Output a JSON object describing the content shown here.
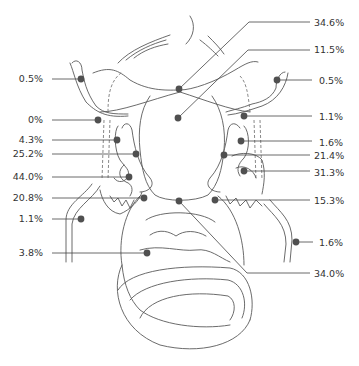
{
  "diagram": {
    "marker_color": "#505050",
    "line_color": "#444444",
    "text_color": "#333333",
    "callouts": [
      {
        "id": "left-tube-fimbria-top",
        "side": "left",
        "value": "0.5%"
      },
      {
        "id": "left-tube-isthmus",
        "side": "left",
        "value": "0%"
      },
      {
        "id": "left-tube-ampulla-upper",
        "side": "left",
        "value": "4.3%"
      },
      {
        "id": "left-ovary-upper",
        "side": "left",
        "value": "25.2%"
      },
      {
        "id": "left-ovary-mid",
        "side": "left",
        "value": "44.0%"
      },
      {
        "id": "left-ovary-lower",
        "side": "left",
        "value": "20.8%"
      },
      {
        "id": "left-ligament",
        "side": "left",
        "value": "1.1%"
      },
      {
        "id": "cervix-body",
        "side": "left",
        "value": "3.8%"
      },
      {
        "id": "uterus-fundus-top",
        "side": "right",
        "value": "34.6%"
      },
      {
        "id": "uterus-body-center",
        "side": "right",
        "value": "11.5%"
      },
      {
        "id": "right-tube-fimbria-top",
        "side": "right",
        "value": "0.5%"
      },
      {
        "id": "right-tube-isthmus",
        "side": "right",
        "value": "1.1%"
      },
      {
        "id": "right-tube-ampulla",
        "side": "right",
        "value": "1.6%"
      },
      {
        "id": "right-ovary-upper",
        "side": "right",
        "value": "21.4%"
      },
      {
        "id": "right-ovary-mid",
        "side": "right",
        "value": "31.3%"
      },
      {
        "id": "right-ovary-lower",
        "side": "right",
        "value": "15.3%"
      },
      {
        "id": "right-ligament",
        "side": "right",
        "value": "1.6%"
      },
      {
        "id": "uterus-lower-segment",
        "side": "right",
        "value": "34.0%"
      }
    ]
  }
}
